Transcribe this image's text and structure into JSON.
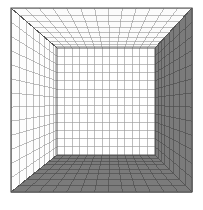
{
  "figure": {
    "title": "One-point perspective wireframe box",
    "type": "line-drawing",
    "canvas": {
      "width": 203,
      "height": 210
    },
    "background_color": "#ffffff"
  },
  "geometry": {
    "front_rect": {
      "x0": 11,
      "y0": 8,
      "x1": 192,
      "y1": 192
    },
    "back_rect": {
      "x0": 57,
      "y0": 48,
      "x1": 155,
      "y1": 155
    },
    "vanishing_point": {
      "x": 106,
      "y": 101
    },
    "grid_divisions": {
      "back_wall_u": 13,
      "back_wall_v": 13,
      "depth_steps": 9
    }
  },
  "faces": [
    {
      "name": "back-wall",
      "label": "Back wall",
      "fill": "#ffffff",
      "stroke": "#9a9a9a",
      "shading": "lightest"
    },
    {
      "name": "ceiling",
      "label": "Ceiling",
      "fill": "#fbfbfb",
      "stroke": "#8c8c8c",
      "shading": "light"
    },
    {
      "name": "left-wall",
      "label": "Left wall",
      "fill": "#fdfdfd",
      "stroke": "#8c8c8c",
      "shading": "light"
    },
    {
      "name": "right-wall",
      "label": "Right wall",
      "fill": "#7b7b7b",
      "stroke": "#4a4a4a",
      "shading": "dark"
    },
    {
      "name": "floor",
      "label": "Floor",
      "fill": "#7b7b7b",
      "stroke": "#4a4a4a",
      "shading": "dark"
    }
  ],
  "colors": {
    "outline": "#555555",
    "light_grid": "#8f8f8f",
    "dark_grid": "#464646",
    "shaded_fill": "#7b7b7b",
    "light_fill": "#fcfcfc",
    "white": "#ffffff"
  },
  "edges": {
    "outer_frame_label": "Front opening rectangle",
    "inner_frame_label": "Back wall rectangle",
    "diagonal_label": "Receding corner edge"
  }
}
